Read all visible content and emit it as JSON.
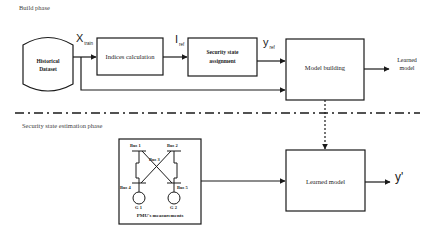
{
  "phases": {
    "build": "Build phase",
    "estimation": "Security state estimation phase"
  },
  "build_phase": {
    "dataset": {
      "line1": "Historical",
      "line2": "Dataset"
    },
    "x_var": {
      "symbol": "X",
      "subscript": "train"
    },
    "indices_box": "Indices calculation",
    "i_var": {
      "symbol": "I",
      "subscript": "ref"
    },
    "security_box": {
      "line1": "Security state",
      "line2": "assignment"
    },
    "y_var": {
      "symbol": "y",
      "subscript": "ref"
    },
    "model_building_box": "Model building",
    "output": {
      "line1": "Learned",
      "line2": "model"
    }
  },
  "estimation_phase": {
    "pmu_box": {
      "buses": [
        "Bus 1",
        "Bus 2",
        "Bus 3",
        "Bus 4",
        "Bus 5"
      ],
      "generators": [
        "G 1",
        "G 2"
      ],
      "caption": "PMU's measurements"
    },
    "learned_model_box": "Learned model",
    "output_symbol": "y'"
  },
  "colors": {
    "stroke": "#1a1a1a",
    "background": "#ffffff"
  }
}
